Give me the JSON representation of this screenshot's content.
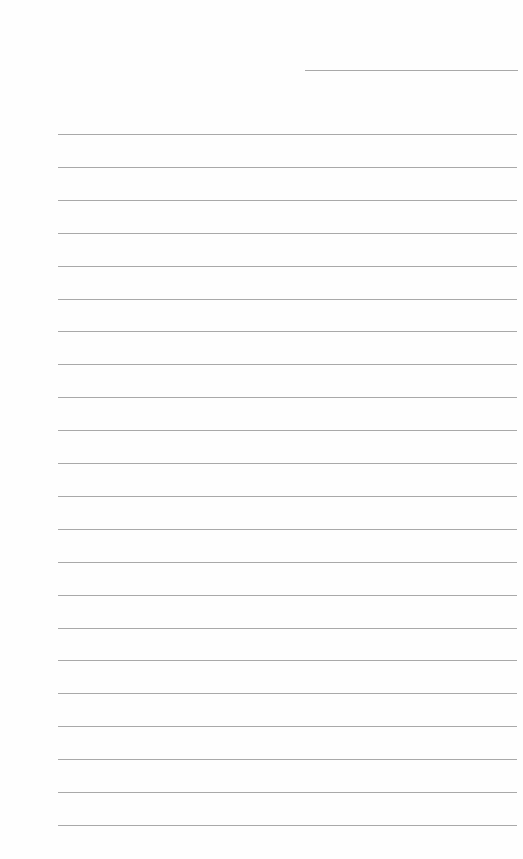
{
  "page": {
    "type": "lined-paper",
    "background": "#ffffff",
    "line_color": "#a9a9a9",
    "date_line": {
      "x": 305,
      "y": 70,
      "width": 213
    },
    "ruled_lines": {
      "count": 22,
      "start_x": 58,
      "start_y": 134,
      "spacing": 32.9,
      "width": 459
    }
  }
}
